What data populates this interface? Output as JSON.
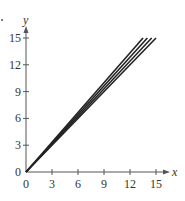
{
  "chart_data": {
    "type": "line",
    "title": "",
    "xlabel": "x",
    "ylabel": "y",
    "xlim": [
      0,
      16
    ],
    "ylim": [
      0,
      16
    ],
    "x_ticks": [
      "0",
      "3",
      "6",
      "9",
      "12",
      "15"
    ],
    "y_ticks": [
      "0",
      "3",
      "6",
      "9",
      "12",
      "15"
    ],
    "grid": false,
    "legend": null,
    "series": [
      {
        "name": "line 1",
        "x": [
          0,
          13.5
        ],
        "y": [
          0,
          15
        ]
      },
      {
        "name": "line 2",
        "x": [
          0,
          14
        ],
        "y": [
          0,
          15
        ]
      },
      {
        "name": "line 3",
        "x": [
          0,
          14.5
        ],
        "y": [
          0,
          15
        ]
      },
      {
        "name": "line 4",
        "x": [
          0,
          15
        ],
        "y": [
          0,
          15
        ]
      }
    ]
  },
  "colors": {
    "line": "#222222",
    "axis": "#555555"
  }
}
